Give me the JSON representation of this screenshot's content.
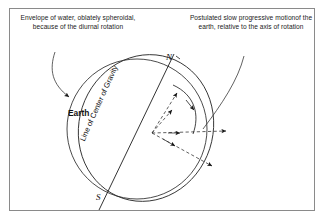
{
  "figure": {
    "background_color": "#ffffff",
    "border_color": "#8a8a8a",
    "line_color": "#1a1a1a"
  },
  "captions": {
    "left": "Envelope of water, oblately spheroidal, because of the diurnal rotation",
    "right": "Postulated slow progressive motionof the earth, relative to the axis of rotation"
  },
  "labels": {
    "body": "Earth",
    "pole_north": "N",
    "pole_south": "S",
    "axis_line": "Line of Center of Gravity"
  },
  "geometry": {
    "center": {
      "x": 152,
      "y": 133
    },
    "solid_circle": {
      "cx": 137,
      "cy": 129,
      "r": 70
    },
    "tilted_ellipse": {
      "cx": 146,
      "cy": 128,
      "rx": 67,
      "ry": 74,
      "rotation_deg": 18
    },
    "axis_endpoints": {
      "north": {
        "x": 172,
        "y": 58
      },
      "south": {
        "x": 101,
        "y": 206
      }
    },
    "dashed_ray_count": 4,
    "rotation_arc": "clockwise-progressive"
  }
}
